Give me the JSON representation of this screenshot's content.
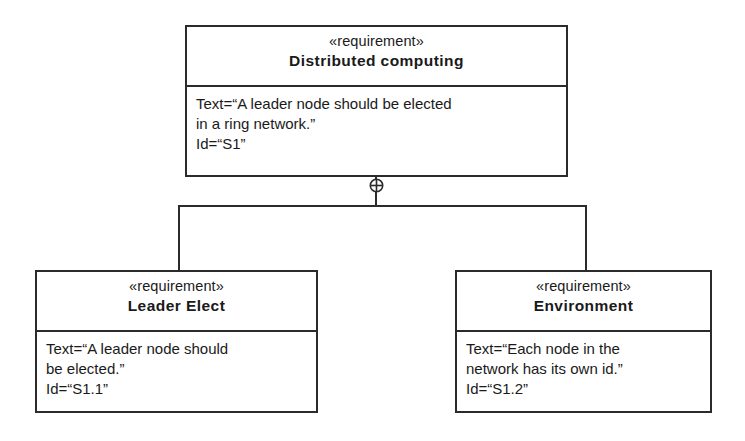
{
  "diagram": {
    "kind": "sysml-requirement-diagram",
    "relationship": "containment",
    "containment_symbol": "circle-plus",
    "line_color": "#2b2b2b",
    "background_color": "#ffffff"
  },
  "blocks": {
    "parent": {
      "stereotype": "«requirement»",
      "title": "Distributed computing",
      "body": "Text=“A leader node should be elected\nin a ring network.”\nId=“S1”",
      "properties": {
        "text": "A leader node should be elected in a ring network.",
        "id": "S1"
      }
    },
    "child_left": {
      "stereotype": "«requirement»",
      "title": "Leader Elect",
      "body": "Text=“A leader node should\nbe elected.”\nId=“S1.1”",
      "properties": {
        "text": "A leader node should be elected.",
        "id": "S1.1"
      }
    },
    "child_right": {
      "stereotype": "«requirement»",
      "title": "Environment",
      "body": "Text=“Each node in the\nnetwork has its own id.”\nId=“S1.2”",
      "properties": {
        "text": "Each node in the network has its own id.",
        "id": "S1.2"
      }
    }
  }
}
